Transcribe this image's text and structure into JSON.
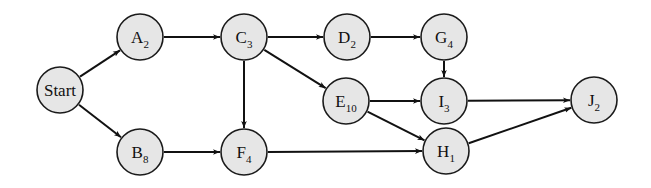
{
  "diagram": {
    "type": "network / precedence graph",
    "node_radius": 23,
    "colors": {
      "node_fill": "#e6e6e6",
      "stroke": "#111111",
      "background": "#ffffff"
    },
    "nodes": [
      {
        "id": "Start",
        "letter": "Start",
        "sub": "",
        "x": 60,
        "y": 90
      },
      {
        "id": "A",
        "letter": "A",
        "sub": "2",
        "x": 140,
        "y": 37
      },
      {
        "id": "B",
        "letter": "B",
        "sub": "8",
        "x": 140,
        "y": 152
      },
      {
        "id": "C",
        "letter": "C",
        "sub": "3",
        "x": 244,
        "y": 37
      },
      {
        "id": "D",
        "letter": "D",
        "sub": "2",
        "x": 347,
        "y": 37
      },
      {
        "id": "G",
        "letter": "G",
        "sub": "4",
        "x": 444,
        "y": 37
      },
      {
        "id": "E",
        "letter": "E",
        "sub": "10",
        "x": 346,
        "y": 101
      },
      {
        "id": "I",
        "letter": "I",
        "sub": "3",
        "x": 444,
        "y": 101
      },
      {
        "id": "F",
        "letter": "F",
        "sub": "4",
        "x": 244,
        "y": 152
      },
      {
        "id": "H",
        "letter": "H",
        "sub": "1",
        "x": 446,
        "y": 151
      },
      {
        "id": "J",
        "letter": "J",
        "sub": "2",
        "x": 594,
        "y": 100
      }
    ],
    "edges": [
      {
        "from": "Start",
        "to": "A"
      },
      {
        "from": "Start",
        "to": "B"
      },
      {
        "from": "A",
        "to": "C"
      },
      {
        "from": "B",
        "to": "F"
      },
      {
        "from": "C",
        "to": "D"
      },
      {
        "from": "C",
        "to": "E"
      },
      {
        "from": "C",
        "to": "F"
      },
      {
        "from": "D",
        "to": "G"
      },
      {
        "from": "G",
        "to": "I"
      },
      {
        "from": "E",
        "to": "I"
      },
      {
        "from": "E",
        "to": "H"
      },
      {
        "from": "F",
        "to": "H"
      },
      {
        "from": "I",
        "to": "J"
      },
      {
        "from": "H",
        "to": "J"
      }
    ]
  }
}
